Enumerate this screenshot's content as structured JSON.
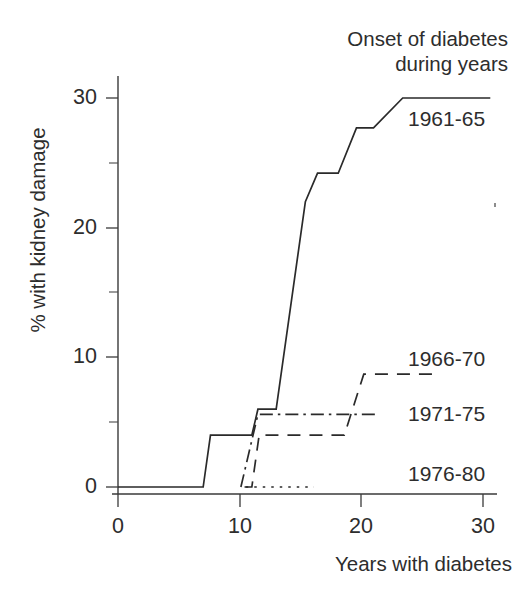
{
  "chart_data": {
    "type": "line",
    "title": "",
    "xlabel": "Years with diabetes",
    "ylabel": "% with kidney damage",
    "legend_title_line1": "Onset of diabetes",
    "legend_title_line2": "during years",
    "legend_position": "inline-right",
    "grid": false,
    "xlim": [
      0,
      30.8
    ],
    "ylim": [
      0,
      31.5
    ],
    "xticks": [
      0,
      10,
      20,
      30
    ],
    "xtick_labels": [
      "0",
      "10",
      "20",
      "30"
    ],
    "xticks_minor": [
      5,
      15,
      25
    ],
    "yticks": [
      0,
      10,
      20,
      30
    ],
    "ytick_labels": [
      "0",
      "10",
      "20",
      "30"
    ],
    "yticks_minor": [
      5,
      15,
      25
    ],
    "series": [
      {
        "name": "1961-65",
        "style": "solid",
        "label_x": 24.0,
        "label_y": 28.0,
        "x": [
          0,
          7.0,
          7.6,
          11.0,
          11.5,
          13.0,
          15.4,
          16.4,
          18.1,
          19.6,
          21.0,
          23.4,
          30.6
        ],
        "y": [
          0,
          0,
          4.0,
          4.0,
          6.0,
          6.0,
          22.0,
          24.2,
          24.2,
          27.7,
          27.7,
          30.0,
          30.0
        ]
      },
      {
        "name": "1966-70",
        "style": "dashed",
        "label_x": 24.0,
        "label_y": 10.0,
        "x": [
          10.4,
          11.0,
          11.6,
          18.6,
          20.2,
          26.2
        ],
        "y": [
          0,
          0,
          4.0,
          4.0,
          8.7,
          8.7
        ]
      },
      {
        "name": "1971-75",
        "style": "dashdot",
        "label_x": 24.0,
        "label_y": 5.6,
        "x": [
          10.1,
          11.5,
          21.2
        ],
        "y": [
          0,
          5.6,
          5.6
        ]
      },
      {
        "name": "1976-80",
        "style": "dotted",
        "label_x": 24.0,
        "label_y": 0.6,
        "x": [
          10.5,
          16.1
        ],
        "y": [
          0,
          0
        ]
      }
    ]
  },
  "labels": {
    "series_1961_65": "1961-65",
    "series_1966_70": "1966-70",
    "series_1971_75": "1971-75",
    "series_1976_80": "1976-80",
    "y_axis_title": "% with kidney damage",
    "x_axis_title": "Years with diabetes",
    "legend_line1": "Onset of diabetes",
    "legend_line2": "during years",
    "ytick_30": "30",
    "ytick_20": "20",
    "ytick_10": "10",
    "ytick_0": "0",
    "xtick_0": "0",
    "xtick_10": "10",
    "xtick_20": "20",
    "xtick_30": "30"
  },
  "colors": {
    "ink": "#2b2b2b",
    "background": "#ffffff"
  }
}
